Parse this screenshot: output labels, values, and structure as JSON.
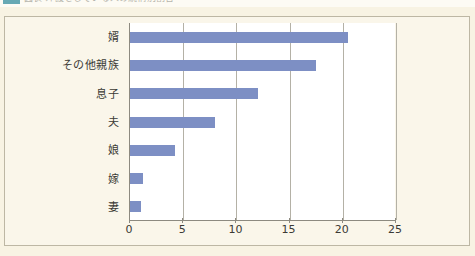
{
  "caption": {
    "marker_icon": "legend-color-swatch",
    "text": "図表 介護をしている人の続柄別割合"
  },
  "colors": {
    "bar": "#7d8fc4",
    "page_background": "#f8f3e3",
    "plot_background": "#ffffff",
    "axis": "#8d8a80",
    "gridline": "#b4b1a6",
    "caption_swatch": "#4c9aa8"
  },
  "chart_data": {
    "type": "bar",
    "orientation": "horizontal",
    "title": "",
    "xlabel": "",
    "ylabel": "",
    "xlim": [
      0,
      25
    ],
    "xticks": [
      "0",
      "5",
      "10",
      "15",
      "20",
      "25"
    ],
    "grid": true,
    "legend": false,
    "categories": [
      "婿",
      "その他親族",
      "息子",
      "夫",
      "娘",
      "嫁",
      "妻"
    ],
    "values": [
      20.5,
      17.5,
      12.0,
      8.0,
      4.2,
      1.2,
      1.0
    ],
    "series": [
      {
        "name": "割合",
        "values": [
          20.5,
          17.5,
          12.0,
          8.0,
          4.2,
          1.2,
          1.0
        ]
      }
    ]
  }
}
